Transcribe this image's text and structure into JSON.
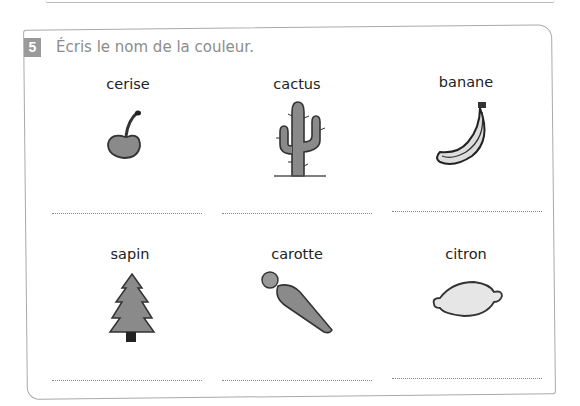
{
  "exercise": {
    "number": "5",
    "instruction": "Écris le nom de la couleur."
  },
  "items": [
    {
      "label": "cerise",
      "icon": "cherry-icon",
      "answer": ""
    },
    {
      "label": "cactus",
      "icon": "cactus-icon",
      "answer": ""
    },
    {
      "label": "banane",
      "icon": "banana-icon",
      "answer": ""
    },
    {
      "label": "sapin",
      "icon": "fir-tree-icon",
      "answer": ""
    },
    {
      "label": "carotte",
      "icon": "carrot-icon",
      "answer": ""
    },
    {
      "label": "citron",
      "icon": "lemon-icon",
      "answer": ""
    }
  ]
}
